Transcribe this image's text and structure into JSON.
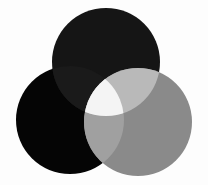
{
  "diagram": {
    "type": "three-circle-venn",
    "background": "#fdfdfd",
    "circles": [
      {
        "id": "top",
        "cx": 106,
        "cy": 62,
        "r": 54,
        "color": "#151515"
      },
      {
        "id": "left",
        "cx": 70,
        "cy": 120,
        "r": 54,
        "color": "#050505"
      },
      {
        "id": "right",
        "cx": 138,
        "cy": 122,
        "r": 54,
        "color": "#8a8a8a"
      }
    ],
    "overlaps": {
      "top_left": "#1a1a1a",
      "top_right": "#b9b9b9",
      "left_right": "#a0a0a0",
      "all_three": "#f4f4f4"
    }
  }
}
